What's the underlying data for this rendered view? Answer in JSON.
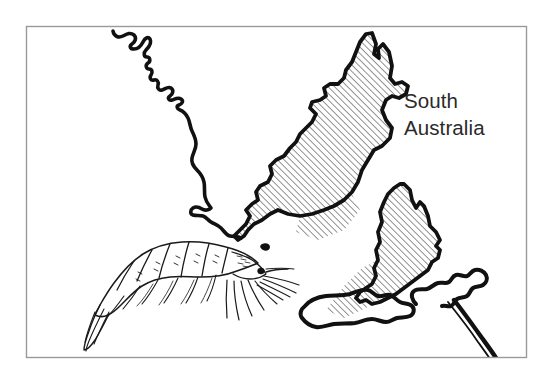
{
  "figure": {
    "name": "south-australia-prawn-fishery-map",
    "background_color": "#ffffff",
    "ink_color": "#111111",
    "frame": {
      "name": "map-frame-border",
      "x": 26,
      "y": 26,
      "width": 501,
      "height": 332,
      "stroke_color": "#9a9a9a",
      "stroke_width": 1.4
    }
  },
  "labels": {
    "region_title_line1": "South",
    "region_title_line2": "Australia",
    "region_title_color": "#2a2a2a",
    "region_title_x": 404,
    "region_title_line1_y": 108,
    "region_title_line2_y": 135
  },
  "hatching": {
    "name": "fishery-zone-hatch",
    "angle_degrees": 45,
    "spacing_px": 4.6,
    "stroke_color": "#1a1a1a",
    "stroke_width": 0.95,
    "description": "diagonal lines running lower-left to upper-right"
  },
  "map_features": [
    {
      "name": "west-coastline",
      "type": "coastline",
      "hatched": false,
      "description": "wiggly west coast of Eyre Peninsula running from top edge down to the gulf"
    },
    {
      "name": "eyre-peninsula",
      "type": "landmass",
      "hatched": true,
      "description": "large hatched peninsula with narrow spike at north, hatching extends into gulf waters"
    },
    {
      "name": "yorke-peninsula",
      "type": "landmass",
      "hatched": true,
      "description": "smaller hatched peninsula east of Eyre, hatching extends southwest into gulf"
    },
    {
      "name": "kangaroo-island",
      "type": "island",
      "hatched": false,
      "description": "elongated island in lower centre-left of map"
    },
    {
      "name": "fleurieu-peninsula",
      "type": "coastline",
      "hatched": false,
      "description": "mainland coast lower right with headland running off toward bottom-right corner"
    }
  ],
  "illustration": {
    "name": "prawn-illustration",
    "subject": "prawn",
    "orientation": "head to the right, tail fan to the lower left",
    "parts": [
      "tail-fan",
      "abdominal-segments",
      "carapace",
      "eye",
      "antennae",
      "pereiopods",
      "pleopods"
    ]
  }
}
